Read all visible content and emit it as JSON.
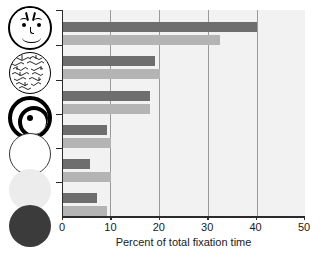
{
  "chart_data": {
    "type": "bar",
    "orientation": "horizontal",
    "title": "",
    "xlabel": "Percent of total fixation time",
    "ylabel": "",
    "xlim": [
      0,
      50
    ],
    "xticks": [
      0,
      10,
      20,
      30,
      40,
      50
    ],
    "xticklabels": [
      "0",
      "10",
      "20",
      "30",
      "40",
      "50"
    ],
    "grid": "vertical gridlines at 10, 20, 30, 40",
    "legend": "none",
    "categories": [
      "face",
      "scrambled-face",
      "bullseye",
      "white-disc",
      "light-gray-disc",
      "dark-disc"
    ],
    "category_icons": [
      "face-icon",
      "scrambled-face-icon",
      "bullseye-icon",
      "white-circle-icon",
      "light-gray-circle-icon",
      "dark-circle-icon"
    ],
    "series": [
      {
        "name": "dark",
        "color": "#6e6e6e",
        "values": [
          40.0,
          19.0,
          18.0,
          9.0,
          5.5,
          7.0
        ]
      },
      {
        "name": "light",
        "color": "#b4b4b4",
        "values": [
          32.5,
          20.0,
          18.0,
          10.0,
          10.0,
          9.0
        ]
      }
    ],
    "plot_background": "#f2f2f2",
    "axis_color": "#2b2b2b",
    "gridline_color": "#9a9a9a"
  },
  "axis": {
    "x_label": "Percent of total fixation time",
    "ticks": [
      "0",
      "10",
      "20",
      "30",
      "40",
      "50"
    ]
  }
}
